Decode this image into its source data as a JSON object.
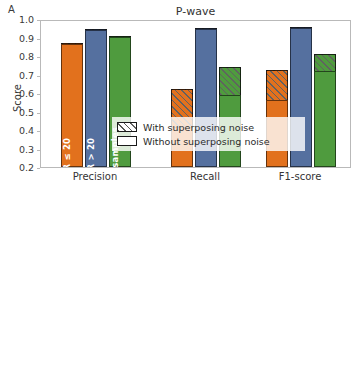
{
  "figure": {
    "ylabel": "Score",
    "legend": {
      "with_noise": "With superposing noise",
      "without_noise": "Without superposing noise"
    },
    "series_labels": {
      "low_snr": "SNR ≤ 20",
      "high_snr": "SNR > 20",
      "total": "Total samples"
    },
    "colors": {
      "low_snr": "#e2711d",
      "high_snr": "#55709f",
      "total": "#4f9b3e"
    }
  },
  "panels": [
    {
      "letter": "A",
      "title": "P-wave"
    },
    {
      "letter": "B",
      "title": "S-wave"
    }
  ],
  "chart_data": [
    {
      "type": "bar",
      "title": "P-wave",
      "panel": "A",
      "xlabel": "",
      "ylabel": "Score",
      "ylim": [
        0.2,
        1.0
      ],
      "yticks": [
        "0.2",
        "0.3",
        "0.4",
        "0.5",
        "0.6",
        "0.7",
        "0.8",
        "0.9",
        "1.0"
      ],
      "categories": [
        "Precision",
        "Recall",
        "F1-score"
      ],
      "legend_position": "lower center",
      "grid": false,
      "series": [
        {
          "name": "SNR ≤ 20",
          "color": "#e2711d",
          "without_noise": [
            0.865,
            0.415,
            0.56
          ],
          "with_noise": [
            0.87,
            0.623,
            0.723
          ]
        },
        {
          "name": "SNR > 20",
          "color": "#55709f",
          "without_noise": [
            0.94,
            0.948,
            0.95
          ],
          "with_noise": [
            0.944,
            0.952,
            0.956
          ]
        },
        {
          "name": "Total samples",
          "color": "#4f9b3e",
          "without_noise": [
            0.903,
            0.59,
            0.718
          ],
          "with_noise": [
            0.908,
            0.738,
            0.812
          ]
        }
      ]
    },
    {
      "type": "bar",
      "title": "S-wave",
      "panel": "B",
      "xlabel": "",
      "ylabel": "Score",
      "ylim": [
        0.2,
        0.9
      ],
      "yticks": [
        "0.2",
        "0.3",
        "0.4",
        "0.5",
        "0.6",
        "0.7",
        "0.8",
        "0.9"
      ],
      "categories": [
        "Precision",
        "Recall",
        "F1-score"
      ],
      "legend_position": "lower center",
      "grid": false,
      "series": [
        {
          "name": "SNR ≤ 20",
          "color": "#e2711d",
          "without_noise": [
            0.703,
            0.455,
            0.555
          ],
          "with_noise": [
            0.715,
            0.58,
            0.645
          ]
        },
        {
          "name": "SNR > 20",
          "color": "#55709f",
          "without_noise": [
            0.808,
            0.8,
            0.808
          ],
          "with_noise": [
            0.815,
            0.808,
            0.816
          ]
        },
        {
          "name": "Total samples",
          "color": "#4f9b3e",
          "without_noise": [
            0.751,
            0.575,
            0.655
          ],
          "with_noise": [
            0.757,
            0.661,
            0.71
          ]
        }
      ]
    }
  ]
}
